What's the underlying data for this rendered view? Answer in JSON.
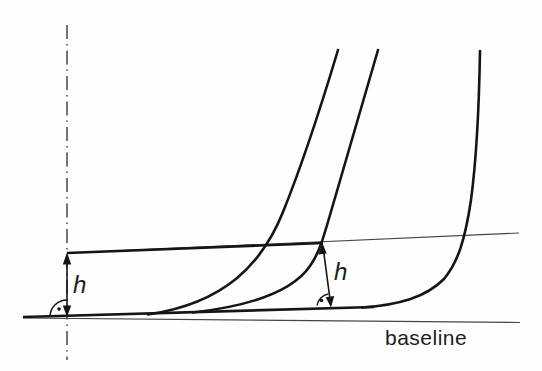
{
  "figure": {
    "kind": "line-art technical diagram",
    "labels": {
      "height_left": "h",
      "height_right": "h",
      "baseline": "baseline"
    },
    "elements": [
      "centerline (dash-dot vertical reference line)",
      "baseline (thin straight line)",
      "keel-line (thick line tangent to curves)",
      "sheer-line (sloped line, thick near centerline, thin extension)",
      "profile-curve-1",
      "profile-curve-2",
      "profile-curve-3",
      "height-arrow-left (double-headed, perpendicular to baseline)",
      "height-arrow-right (double-headed, perpendicular to sheer line)",
      "right-angle-arc-left (arc with dot)",
      "right-angle-arc-right (arc with dot)"
    ],
    "colors": {
      "background": "#fefefe",
      "thick_line": "#151515",
      "thin_line": "#454545",
      "centerline": "#3a3a3a",
      "text": "#1c1c1c"
    }
  }
}
